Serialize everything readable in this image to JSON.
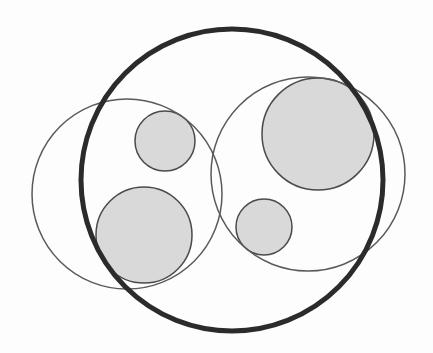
{
  "diagram": {
    "type": "nested-circles",
    "width": 433,
    "height": 353,
    "colors": {
      "background": "#fdfdfd",
      "bold_stroke": "#2b2b2b",
      "thin_stroke": "#5a5a5a",
      "fill": "#d9d9d9",
      "fill_stroke": "#4a4a4a"
    },
    "bold_circle": {
      "cx": 232,
      "cy": 180,
      "r": 151,
      "stroke_width": 5
    },
    "outline_circles": [
      {
        "id": "left-outline",
        "cx": 127,
        "cy": 194,
        "r": 95,
        "stroke_width": 1.5
      },
      {
        "id": "right-outline",
        "cx": 308,
        "cy": 174,
        "r": 97,
        "stroke_width": 1.5
      }
    ],
    "filled_circles": [
      {
        "id": "small-upper-left",
        "cx": 165,
        "cy": 141,
        "r": 30
      },
      {
        "id": "large-lower-left",
        "cx": 144,
        "cy": 235,
        "r": 48
      },
      {
        "id": "large-upper-right",
        "cx": 318,
        "cy": 134,
        "r": 56
      },
      {
        "id": "small-lower-right",
        "cx": 264,
        "cy": 227,
        "r": 28
      }
    ]
  }
}
